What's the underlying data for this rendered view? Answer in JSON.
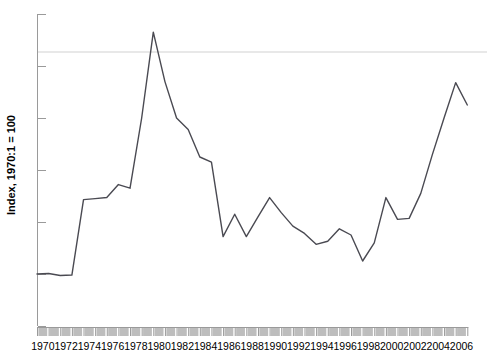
{
  "chart_data": {
    "type": "line",
    "title": "",
    "xlabel": "",
    "ylabel": "Index, 1970:1 = 100",
    "xlim": [
      1970,
      2007
    ],
    "ylim": [
      0,
      600
    ],
    "yticks": [
      0,
      100,
      200,
      300,
      400,
      500,
      600
    ],
    "xticks": [
      1970,
      1972,
      1974,
      1976,
      1978,
      1980,
      1982,
      1984,
      1986,
      1988,
      1990,
      1992,
      1994,
      1996,
      1998,
      2000,
      2002,
      2004,
      2006
    ],
    "grid": false,
    "legend": null,
    "reference_line": {
      "value": 527,
      "color": "#e8e8e8",
      "label": ""
    },
    "line_color": "#4a4a52",
    "line_width": 1.4,
    "x": [
      1970,
      1971,
      1972,
      1973,
      1974,
      1975,
      1976,
      1977,
      1978,
      1979,
      1980,
      1981,
      1982,
      1983,
      1984,
      1985,
      1986,
      1987,
      1988,
      1989,
      1990,
      1991,
      1992,
      1993,
      1994,
      1995,
      1996,
      1997,
      1998,
      1999,
      2000,
      2001,
      2002,
      2003,
      2004,
      2005,
      2006,
      2007
    ],
    "values": [
      100,
      101,
      97,
      98,
      243,
      245,
      247,
      272,
      265,
      400,
      565,
      470,
      400,
      378,
      325,
      315,
      172,
      215,
      172,
      210,
      247,
      218,
      192,
      178,
      157,
      163,
      187,
      175,
      125,
      160,
      247,
      205,
      207,
      255,
      330,
      400,
      468,
      425
    ],
    "series": [
      {
        "name": "Index, 1970:1 = 100",
        "values": [
          100,
          101,
          97,
          98,
          243,
          245,
          247,
          272,
          265,
          400,
          565,
          470,
          400,
          378,
          325,
          315,
          172,
          215,
          172,
          210,
          247,
          218,
          192,
          178,
          157,
          163,
          187,
          175,
          125,
          160,
          247,
          205,
          207,
          255,
          330,
          400,
          468,
          425
        ]
      }
    ],
    "axis": {
      "tick_band_color": "#bdbdbd",
      "axis_color": "#9a9a9a"
    }
  }
}
